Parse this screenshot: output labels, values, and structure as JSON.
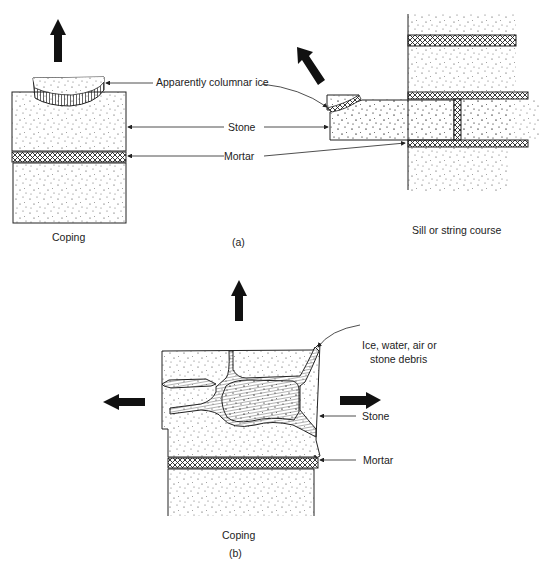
{
  "figure_a": {
    "caption": "(a)",
    "left": {
      "title": "Coping",
      "label_ice": "Apparently columnar ice",
      "label_stone": "Stone",
      "label_mortar": "Mortar"
    },
    "right": {
      "title": "Sill or string course"
    }
  },
  "figure_b": {
    "caption": "(b)",
    "title": "Coping",
    "label_ice_line1": "Ice, water, air or",
    "label_ice_line2": "stone debris",
    "label_stone": "Stone",
    "label_mortar": "Mortar"
  },
  "colors": {
    "ink": "#222222",
    "background": "#ffffff"
  }
}
